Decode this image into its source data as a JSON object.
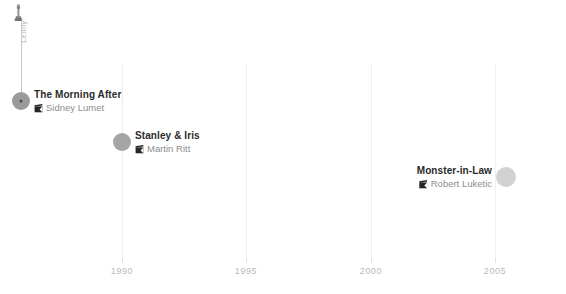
{
  "chart_data": {
    "type": "scatter",
    "title": "",
    "xlabel": "",
    "ylabel": "",
    "xlim": [
      1986.3,
      2007.2
    ],
    "grid": true,
    "legend": false,
    "x_ticks": [
      {
        "value": 1990,
        "label": "1990",
        "px": 122
      },
      {
        "value": 1995,
        "label": "1995",
        "px": 246
      },
      {
        "value": 2000,
        "label": "2000",
        "px": 371
      },
      {
        "value": 2005,
        "label": "2005",
        "px": 495
      }
    ],
    "points": [
      {
        "title": "The Morning After",
        "director": "Sidney Lumet",
        "year": 1986,
        "x_px": 21,
        "y_px": 101,
        "radius": 9,
        "color": "#9a9a9a",
        "label_side": "left",
        "award": true
      },
      {
        "title": "Stanley & Iris",
        "director": "Martin Ritt",
        "year": 1990,
        "x_px": 122,
        "y_px": 142,
        "radius": 9,
        "color": "#a5a5a5",
        "label_side": "left",
        "award": false
      },
      {
        "title": "Monster-in-Law",
        "director": "Robert Luketic",
        "year": 2005,
        "x_px": 506,
        "y_px": 177,
        "radius": 10,
        "color": "#d2d2d2",
        "label_side": "right",
        "award": false
      }
    ],
    "annotations": [
      {
        "label": "Lenny",
        "icon": "oscar-statuette-icon",
        "attached_to": "The Morning After"
      }
    ]
  },
  "colors": {
    "gridline": "#efefef",
    "tick_label": "#b9b9b9",
    "title_text": "#2b2b2b",
    "director_text": "#8d8d8d",
    "annotation_text": "#b0b0b0",
    "stem": "#c9c9c9",
    "marker_core": "#4a4a4a"
  },
  "icons": {
    "director": "clapperboard-icon",
    "award": "oscar-statuette-icon"
  }
}
